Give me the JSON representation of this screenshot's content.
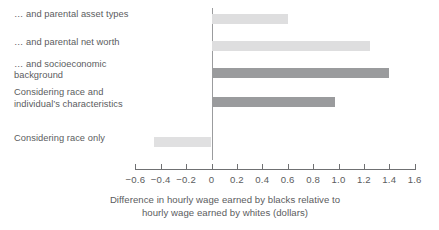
{
  "chart_data": {
    "type": "bar",
    "orientation": "horizontal",
    "title": "",
    "subtitle": "",
    "xlabel_line1": "Difference in hourly wage earned by blacks relative to",
    "xlabel_line2": "hourly wage earned by whites (dollars)",
    "ylabel": "",
    "xlim": [
      -0.6,
      1.6
    ],
    "xticks": [
      -0.6,
      -0.4,
      -0.2,
      0,
      0.2,
      0.4,
      0.6,
      0.8,
      1.0,
      1.2,
      1.4,
      1.6
    ],
    "xtick_labels": [
      "−0.6",
      "−0.4",
      "−0.2",
      "0",
      "0.2",
      "0.4",
      "0.6",
      "0.8",
      "1.0",
      "1.2",
      "1.4",
      "1.6"
    ],
    "grid": false,
    "legend": false,
    "zero_line": true,
    "categories": [
      "… and parental asset types",
      "… and parental net worth",
      "… and socioeconomic\nbackground",
      "Considering race and\nindividual’s characteristics",
      "Considering race only"
    ],
    "values": [
      0.6,
      1.25,
      1.4,
      0.97,
      -0.45
    ],
    "bar_colors": [
      "#dededf",
      "#dededf",
      "#9a9b9d",
      "#9a9b9d",
      "#e0e0e1"
    ],
    "colors": {
      "light_bar": "#dededf",
      "dark_bar": "#9a9b9d",
      "axis": "#6f7072",
      "zero_line": "#9b9c9e",
      "text": "#5b5c5e",
      "background": "#ffffff"
    }
  }
}
